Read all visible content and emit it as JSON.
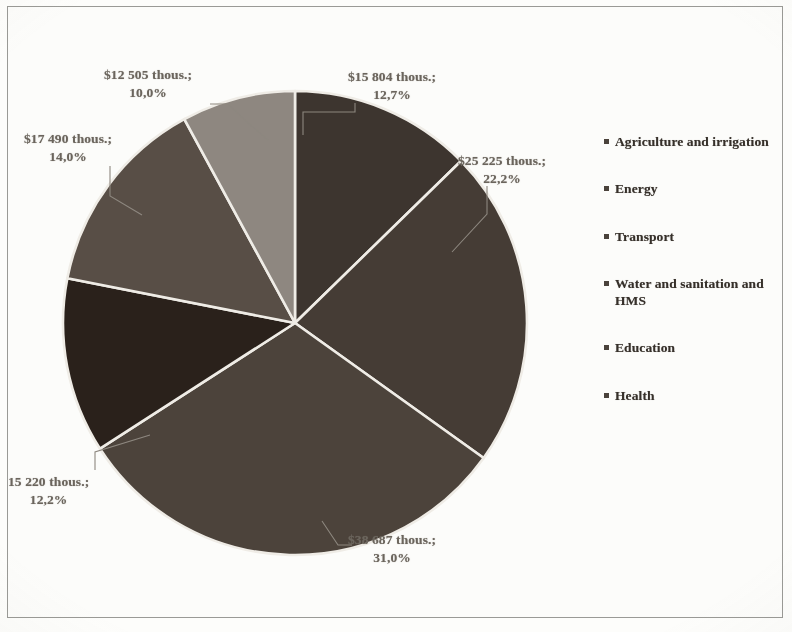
{
  "chart_data": {
    "type": "pie",
    "title": "",
    "subtitle": "",
    "legend_position": "right",
    "grid": false,
    "value_unit": "thous.",
    "currency_symbol": "$",
    "categories": [
      "Agriculture and irrigation",
      "Energy",
      "Transport",
      "Water and sanitation and HMS",
      "Education",
      "Health"
    ],
    "values": [
      15804,
      25225,
      38687,
      15220,
      17490,
      12505
    ],
    "percentages": [
      12.7,
      22.2,
      31.0,
      12.2,
      14.0,
      10.0
    ],
    "slices": [
      {
        "name": "Agriculture and irrigation",
        "value": 15804,
        "percent": 12.7,
        "label": "$15 804 thous.;",
        "percent_label": "12,7%",
        "color": "#3d352f",
        "start_angle": 0.0,
        "end_angle": 45.7
      },
      {
        "name": "Energy",
        "value": 25225,
        "percent": 22.2,
        "label": "$25 225 thous.;",
        "percent_label": "22,2%",
        "color": "#453c35",
        "start_angle": 45.7,
        "end_angle": 125.6
      },
      {
        "name": "Transport",
        "value": 38687,
        "percent": 31.0,
        "label": "$38 687 thous.;",
        "percent_label": "31,0%",
        "color": "#4c433b",
        "start_angle": 125.6,
        "end_angle": 237.2
      },
      {
        "name": "Water and sanitation and HMS",
        "value": 15220,
        "percent": 12.2,
        "label": "15 220 thous.;",
        "percent_label": "12,2%",
        "color": "#2a211b",
        "start_angle": 237.2,
        "end_angle": 281.1
      },
      {
        "name": "Education",
        "value": 17490,
        "percent": 14.0,
        "label": "$17 490 thous.;",
        "percent_label": "14,0%",
        "color": "#584e46",
        "start_angle": 281.1,
        "end_angle": 331.5
      },
      {
        "name": "Health",
        "value": 12505,
        "percent": 10.0,
        "label": "$12 505 thous.;",
        "percent_label": "10,0%",
        "color": "#8e8780",
        "start_angle": 331.5,
        "end_angle": 360.0
      }
    ]
  },
  "labels": {
    "agriculture": {
      "value": "$15 804 thous.;",
      "percent": "12,7%"
    },
    "energy": {
      "value": "$25 225 thous.;",
      "percent": "22,2%"
    },
    "transport": {
      "value": "$38 687 thous.;",
      "percent": "31,0%"
    },
    "water": {
      "value": "15 220 thous.;",
      "percent": "12,2%"
    },
    "education": {
      "value": "$17 490 thous.;",
      "percent": "14,0%"
    },
    "health": {
      "value": "$12 505 thous.;",
      "percent": "10,0%"
    }
  },
  "legend": {
    "items": [
      {
        "label": "Agriculture and irrigation"
      },
      {
        "label": "Energy"
      },
      {
        "label": "Transport"
      },
      {
        "label": "Water and sanitation and HMS"
      },
      {
        "label": "Education"
      },
      {
        "label": "Health"
      }
    ]
  },
  "colors": {
    "agriculture": "#3d352f",
    "energy": "#453c35",
    "transport": "#4c433b",
    "water": "#2a211b",
    "education": "#584e46",
    "health": "#8e8780",
    "separator": "#efece6",
    "page_border": "#9a9a96",
    "label_text": "#6b655d",
    "legend_text": "#36302a"
  }
}
